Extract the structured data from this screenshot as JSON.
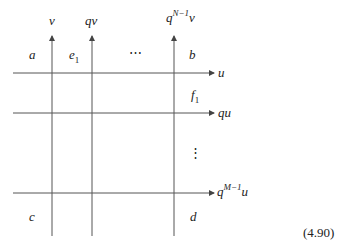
{
  "diagram": {
    "vertical_lines": [
      {
        "x": 52,
        "label": "v"
      },
      {
        "x": 92,
        "label": "qv"
      },
      {
        "x": 174,
        "label_base": "q",
        "label_sup": "N−1",
        "label_tail": "v"
      }
    ],
    "horizontal_lines": [
      {
        "y": 73,
        "label": "u"
      },
      {
        "y": 113,
        "label": "qu"
      },
      {
        "y": 193,
        "label_base": "q",
        "label_sup": "M−1",
        "label_tail": "u"
      }
    ],
    "region_labels": {
      "a": "a",
      "e1_base": "e",
      "e1_sub": "1",
      "dots_h": "⋯",
      "b": "b",
      "f1_base": "f",
      "f1_sub": "1",
      "dots_v": "⋮",
      "c": "c",
      "d": "d"
    },
    "equation_number": "(4.90)",
    "line_color": "#555555"
  }
}
